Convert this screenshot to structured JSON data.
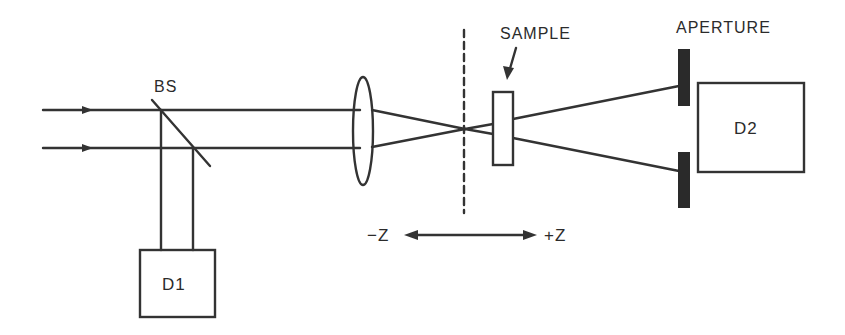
{
  "diagram": {
    "labels": {
      "beam_splitter": "BS",
      "sample": "SAMPLE",
      "aperture": "APERTURE",
      "detector_1": "D1",
      "detector_2": "D2",
      "minus_z": "−Z",
      "plus_z": "+Z"
    },
    "components": [
      {
        "id": "input-beams",
        "type": "arrows",
        "count": 2
      },
      {
        "id": "beam-splitter",
        "type": "mirror",
        "label": "BS"
      },
      {
        "id": "reference-detector",
        "type": "box",
        "label": "D1"
      },
      {
        "id": "lens",
        "type": "ellipse"
      },
      {
        "id": "focal-plane",
        "type": "dashed-line"
      },
      {
        "id": "sample",
        "type": "box",
        "label": "SAMPLE"
      },
      {
        "id": "aperture",
        "type": "bars",
        "label": "APERTURE"
      },
      {
        "id": "transmission-detector",
        "type": "box",
        "label": "D2"
      },
      {
        "id": "z-axis",
        "type": "double-arrow",
        "from": "−Z",
        "to": "+Z"
      }
    ],
    "colors": {
      "line": "#333333",
      "aperture_fill": "#2a2a2a",
      "background": "#ffffff"
    }
  }
}
